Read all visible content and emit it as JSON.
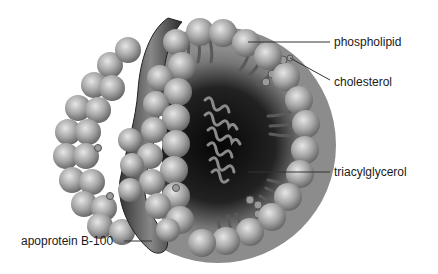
{
  "figure": {
    "labels": [
      {
        "id": "phospholipid",
        "text": "phospholipid"
      },
      {
        "id": "cholesterol",
        "text": "cholesterol"
      },
      {
        "id": "triacylglycerol",
        "text": "triacylglycerol"
      },
      {
        "id": "apoprotein",
        "text": "apoprotein B-100"
      }
    ]
  },
  "colors": {
    "sphere_light": "#d8d8d8",
    "sphere_mid": "#9a9a9a",
    "sphere_dark": "#555555",
    "core_dark": "#111111",
    "leader_line": "#333333",
    "text": "#1a1a1a"
  }
}
